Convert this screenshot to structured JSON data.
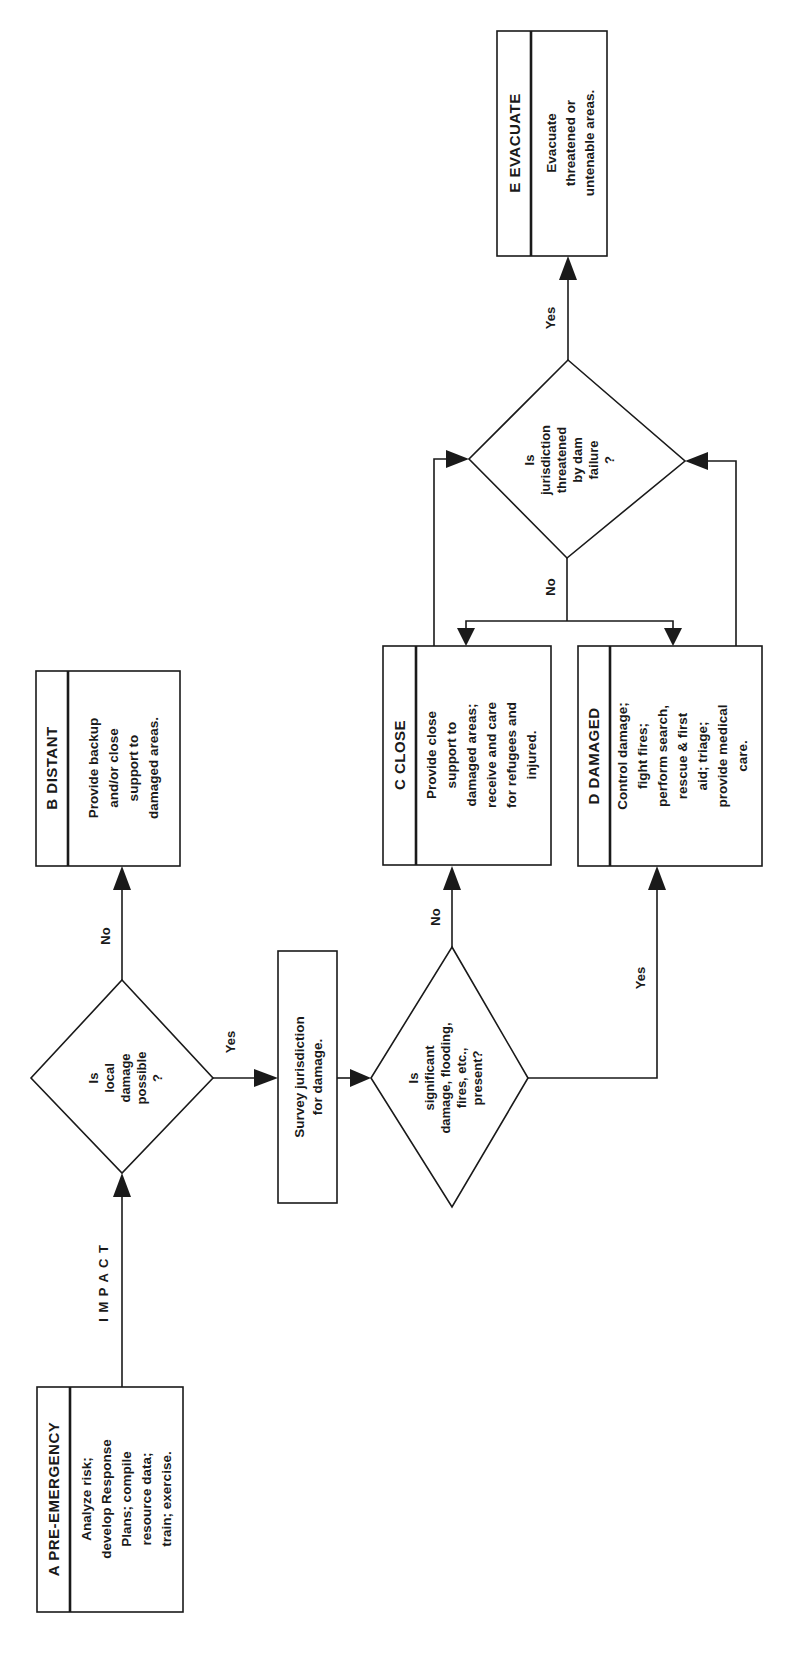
{
  "diagram": {
    "orientation": "rotated-90-ccw",
    "nodes": {
      "A": {
        "letter": "A",
        "title": "PRE-EMERGENCY",
        "header": "A PRE-EMERGENCY",
        "lines": [
          "Analyze risk;",
          "develop Response",
          "Plans; compile",
          "resource data;",
          "train; exercise."
        ]
      },
      "B": {
        "letter": "B",
        "title": "DISTANT",
        "header": "B  DISTANT",
        "lines": [
          "Provide backup",
          "and/or close",
          "support to",
          "damaged areas."
        ]
      },
      "C": {
        "letter": "C",
        "title": "CLOSE",
        "header": "C  CLOSE",
        "lines": [
          "Provide close",
          "support to",
          "damaged areas;",
          "receive and care",
          "for refugees and",
          "injured."
        ]
      },
      "D": {
        "letter": "D",
        "title": "DAMAGED",
        "header": "D  DAMAGED",
        "lines": [
          "Control damage;",
          "fight fires;",
          "perform search,",
          "rescue & first",
          "aid; triage;",
          "provide medical",
          "care."
        ]
      },
      "E": {
        "letter": "E",
        "title": "EVACUATE",
        "header": "E  EVACUATE",
        "lines": [
          "Evacuate",
          "threatened or",
          "untenable areas."
        ]
      },
      "survey": {
        "lines": [
          "Survey jurisdiction",
          "for damage."
        ]
      },
      "q1": {
        "lines": [
          "Is",
          "local",
          "damage",
          "possible",
          "?"
        ]
      },
      "q2": {
        "lines": [
          "Is",
          "significant",
          "damage, flooding,",
          "fires, etc.,",
          "present?"
        ]
      },
      "q3": {
        "lines": [
          "Is",
          "jurisdiction",
          "threatened",
          "by dam",
          "failure",
          "?"
        ]
      }
    },
    "edges": [
      {
        "from": "A",
        "to": "q1",
        "label": "I M P A C T"
      },
      {
        "from": "q1",
        "to": "B",
        "label": "No"
      },
      {
        "from": "q1",
        "to": "survey",
        "label": "Yes"
      },
      {
        "from": "survey",
        "to": "q2",
        "label": ""
      },
      {
        "from": "q2",
        "to": "C",
        "label": "No"
      },
      {
        "from": "q2",
        "to": "D",
        "label": "Yes"
      },
      {
        "from": "C",
        "to": "q3",
        "label": ""
      },
      {
        "from": "D",
        "to": "q3",
        "label": ""
      },
      {
        "from": "q3",
        "to": "C",
        "label": "No"
      },
      {
        "from": "q3",
        "to": "D",
        "label": "No"
      },
      {
        "from": "q3",
        "to": "E",
        "label": "Yes"
      }
    ],
    "labels": {
      "impact": "I M P A C T",
      "q1_no": "No",
      "q1_yes": "Yes",
      "q2_no": "No",
      "q2_yes": "Yes",
      "q3_no": "No",
      "q3_yes": "Yes"
    }
  }
}
